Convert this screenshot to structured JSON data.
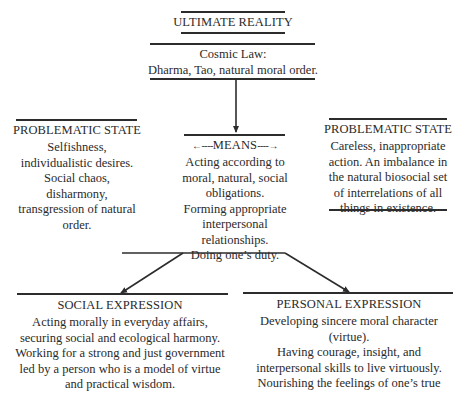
{
  "ultimate_reality": {
    "title": "ULTIMATE REALITY"
  },
  "cosmic_law": {
    "lines": [
      "Cosmic Law:",
      "Dharma, Tao, natural moral order."
    ]
  },
  "means": {
    "title": "MEANS",
    "left_arrow": "←----",
    "right_arrow": "----→",
    "lines": [
      "Acting according to",
      "moral, natural, social",
      "obligations.",
      "Forming appropriate",
      "interpersonal",
      "relationships.",
      "Doing one’s duty."
    ]
  },
  "problematic_left": {
    "title": "PROBLEMATIC STATE",
    "lines": [
      "Selfishness,",
      "individualistic desires.",
      "Social chaos,",
      "disharmony,",
      "transgression of natural",
      "order."
    ]
  },
  "problematic_right": {
    "title": "PROBLEMATIC STATE",
    "lines": [
      "Careless, inappropriate",
      "action. An imbalance in",
      "the natural biosocial set",
      "of interrelations of all",
      "things in existence."
    ]
  },
  "social_expression": {
    "title": "SOCIAL EXPRESSION",
    "lines": [
      "Acting morally in everyday affairs,",
      "securing social and ecological harmony.",
      "Working for a strong and just government",
      "led by a person who is a model of virtue",
      "and practical wisdom."
    ]
  },
  "personal_expression": {
    "title": "PERSONAL EXPRESSION",
    "lines": [
      "Developing sincere moral character",
      "(virtue).",
      "Having courage, insight, and",
      "interpersonal skills to live virtuously.",
      "Nourishing the feelings of one’s true"
    ]
  },
  "colors": {
    "ink": "#2a2a2a",
    "rule": "#2c2c2c",
    "background": "#ffffff"
  }
}
